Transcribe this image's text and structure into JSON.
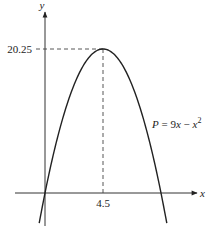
{
  "chart_data": {
    "type": "line",
    "title": "",
    "xlabel": "x",
    "ylabel": "y",
    "equation_label": "P = 9x − x²",
    "function": "P = 9x - x^2",
    "vertex": {
      "x": 4.5,
      "y": 20.25
    },
    "x_ticks": [
      {
        "value": 4.5,
        "label": "4.5"
      }
    ],
    "y_ticks": [
      {
        "value": 20.25,
        "label": "20.25"
      }
    ],
    "roots": [
      0,
      9
    ],
    "xlim": [
      -3.5,
      12
    ],
    "ylim": [
      -4.5,
      27
    ],
    "curve_domain": [
      -0.45,
      9.45
    ],
    "series": [
      {
        "name": "P = 9x - x^2",
        "x": [
          -0.45,
          0,
          1,
          2,
          3,
          4,
          4.5,
          5,
          6,
          7,
          8,
          9,
          9.45
        ],
        "values": [
          -4.25,
          0,
          8,
          14,
          18,
          20,
          20.25,
          20,
          18,
          14,
          8,
          0,
          -4.25
        ]
      }
    ],
    "grid": false,
    "legend": "none",
    "guides": "dashed lines from vertex to both axes"
  }
}
